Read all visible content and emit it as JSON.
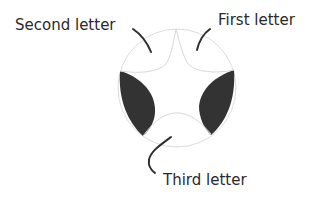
{
  "diagram": {
    "title": "",
    "labels": {
      "first": "First letter",
      "second": "Second letter",
      "third": "Third letter"
    },
    "colors": {
      "outline": "#d8d8d8",
      "fill_dark": "#333333",
      "pointer": "#2e2e2e",
      "text": "#2a2a2a"
    }
  }
}
